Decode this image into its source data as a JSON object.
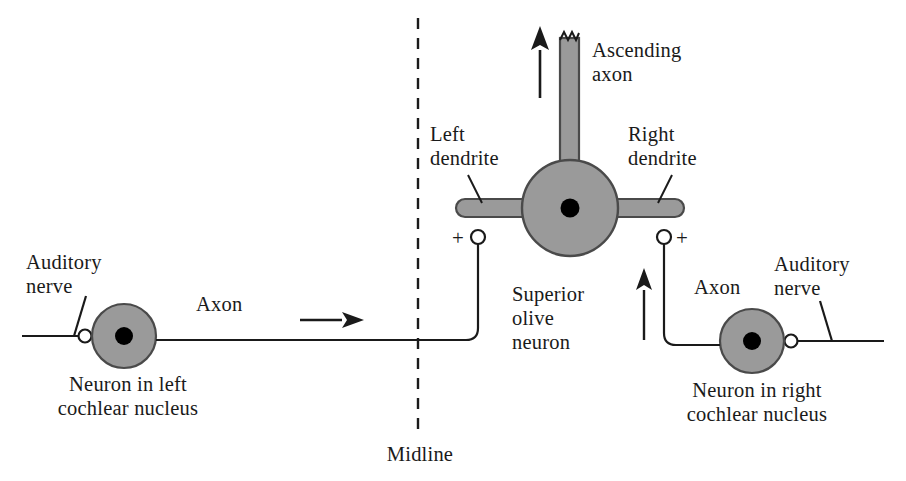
{
  "figure": {
    "background_color": "#ffffff",
    "ink_color": "#1a1a1a",
    "soma_fill_color": "#9a9a9a",
    "nucleus_color": "#000000",
    "width": 906,
    "height": 481
  },
  "labels": {
    "auditory_nerve_left": "Auditory\nnerve",
    "auditory_nerve_right": "Auditory\nnerve",
    "axon_left": "Axon",
    "axon_right": "Axon",
    "neuron_left": "Neuron in left\ncochlear nucleus",
    "neuron_right": "Neuron in right\ncochlear nucleus",
    "left_dendrite": "Left\ndendrite",
    "right_dendrite": "Right\ndendrite",
    "ascending_axon": "Ascending\naxon",
    "superior_olive": "Superior\nolive\nneuron",
    "midline": "Midline",
    "synapse_sign_left": "+",
    "synapse_sign_right": "+"
  },
  "structures": {
    "left_cochlear_neuron": {
      "cx": 124,
      "cy": 336,
      "r": 32
    },
    "right_cochlear_neuron": {
      "cx": 752,
      "cy": 341,
      "r": 32
    },
    "superior_olive_neuron": {
      "cx": 570,
      "cy": 208,
      "r": 48
    },
    "midline_x": 418,
    "midline_top": 18,
    "midline_bottom": 436
  }
}
